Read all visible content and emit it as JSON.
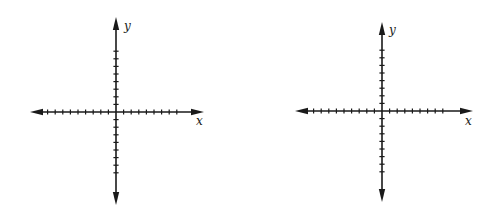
{
  "colors": {
    "background": "#ffffff",
    "ink": "#1a1a1a"
  },
  "graphs": [
    {
      "id": "left-grid",
      "origin": [
        116,
        112
      ],
      "x_extent": [
        30,
        204
      ],
      "y_extent": [
        17,
        205
      ],
      "tick_spacing": 7.6,
      "ticks_left": 9,
      "ticks_right": 8,
      "ticks_up": 8,
      "ticks_down": 8,
      "x_label": "x",
      "y_label": "y",
      "x_label_pos": [
        196,
        125
      ],
      "y_label_pos": [
        124,
        30
      ]
    },
    {
      "id": "right-grid",
      "origin": [
        382,
        111
      ],
      "x_extent": [
        295,
        473
      ],
      "y_extent": [
        22,
        202
      ],
      "tick_spacing": 7.6,
      "ticks_left": 9,
      "ticks_right": 8,
      "ticks_up": 8,
      "ticks_down": 8,
      "x_label": "x",
      "y_label": "y",
      "x_label_pos": [
        465,
        125
      ],
      "y_label_pos": [
        389,
        34
      ]
    }
  ]
}
